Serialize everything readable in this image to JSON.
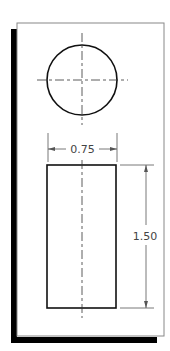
{
  "drawing": {
    "type": "orthographic-projection",
    "views": [
      "top",
      "front"
    ],
    "dimensions": {
      "width": {
        "label": "0.75",
        "value": 0.75
      },
      "height": {
        "label": "1.50",
        "value": 1.5
      }
    }
  },
  "colors": {
    "background": "#ffffff",
    "frame": "#888888",
    "shadow": "#000000",
    "object_line": "#111111",
    "dimension_line": "#555555"
  }
}
